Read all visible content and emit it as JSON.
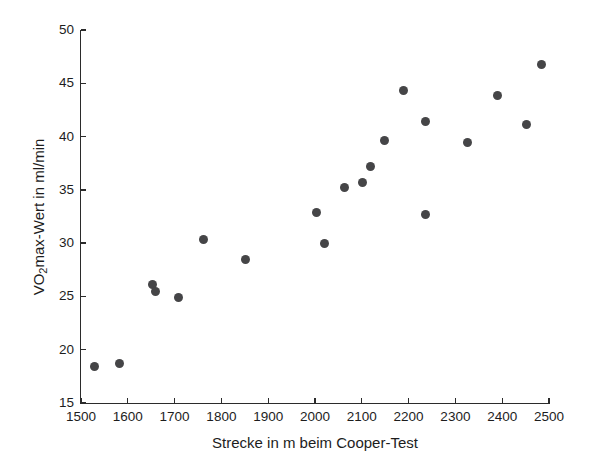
{
  "figure": {
    "background": "#ffffff",
    "axis_color": "#2b2b2b",
    "text_color": "#1d1d1d"
  },
  "chart_data": {
    "type": "scatter",
    "title": "",
    "xlabel": "Strecke in m beim Cooper-Test",
    "ylabel": "VO2max-Wert in ml/min",
    "ylabel_parts": {
      "prefix": "VO",
      "sub": "2",
      "suffix": "max-Wert in ml/min"
    },
    "xlim": [
      1500,
      2500
    ],
    "ylim": [
      15,
      50
    ],
    "x_ticks": [
      1500,
      1600,
      1700,
      1800,
      1900,
      2000,
      2100,
      2200,
      2300,
      2400,
      2500
    ],
    "y_ticks": [
      15,
      20,
      25,
      30,
      35,
      40,
      45,
      50
    ],
    "grid": false,
    "legend": null,
    "marker": {
      "shape": "circle",
      "color": "#454547",
      "size_px": 9
    },
    "points": [
      [
        1528,
        18.4
      ],
      [
        1583,
        18.7
      ],
      [
        1653,
        26.1
      ],
      [
        1659,
        25.5
      ],
      [
        1709,
        24.9
      ],
      [
        1762,
        30.3
      ],
      [
        1852,
        28.5
      ],
      [
        2004,
        32.9
      ],
      [
        2020,
        30.0
      ],
      [
        2062,
        35.2
      ],
      [
        2102,
        35.7
      ],
      [
        2119,
        37.2
      ],
      [
        2149,
        39.6
      ],
      [
        2189,
        44.3
      ],
      [
        2236,
        41.4
      ],
      [
        2236,
        32.7
      ],
      [
        2325,
        39.4
      ],
      [
        2391,
        43.9
      ],
      [
        2451,
        41.1
      ],
      [
        2485,
        46.8
      ]
    ]
  }
}
